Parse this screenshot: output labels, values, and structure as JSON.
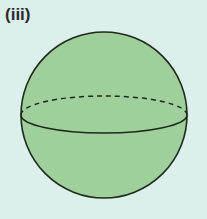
{
  "figure": {
    "label": "(iii)",
    "shape": "sphere",
    "colors": {
      "background": "#dcefeb",
      "fill": "#9fcf9a",
      "stroke": "#1e2a1e"
    },
    "geometry": {
      "cx": 104,
      "cy": 115,
      "r": 83,
      "equator_ry": 18
    }
  }
}
